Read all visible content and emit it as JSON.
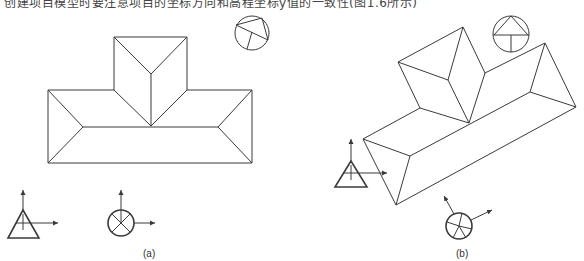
{
  "caption": {
    "partial_text": "创建项目模型时要注意项目的坐标方向和高程坐标y值的一致性(图1.6所示)"
  },
  "figures": [
    {
      "id": "a",
      "label": "(a)",
      "description": "Roof plan view (T-shaped hip roof) with north arrow circle and coordinate symbols"
    },
    {
      "id": "b",
      "label": "(b)",
      "description": "Rotated roof plan view with rotated north arrow circle and coordinate symbols"
    }
  ],
  "symbols": {
    "survey_point": "triangle-with-axes",
    "project_base_point": "circle-with-cross-and-axes",
    "north_arrow": "circle-compass"
  }
}
